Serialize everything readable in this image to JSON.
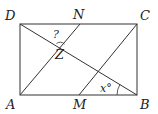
{
  "figure": {
    "type": "geometry-diagram",
    "shape": "rectangle ABCD with segments AN, MC and diagonal DB",
    "points": {
      "A": {
        "label": "A",
        "x": 20,
        "y": 95
      },
      "B": {
        "label": "B",
        "x": 137,
        "y": 95
      },
      "C": {
        "label": "C",
        "x": 137,
        "y": 24
      },
      "D": {
        "label": "D",
        "x": 20,
        "y": 24
      },
      "N": {
        "label": "N",
        "x": 80,
        "y": 24
      },
      "M": {
        "label": "M",
        "x": 79,
        "y": 95
      },
      "Z": {
        "label": "Z"
      }
    },
    "segments": [
      "AB",
      "BC",
      "CD",
      "DA",
      "AN",
      "MC",
      "DB"
    ],
    "angle_labels": {
      "unknown": "?",
      "given": "x°"
    },
    "colors": {
      "line": "#333333",
      "text": "#222222",
      "background": "#ffffff"
    }
  }
}
